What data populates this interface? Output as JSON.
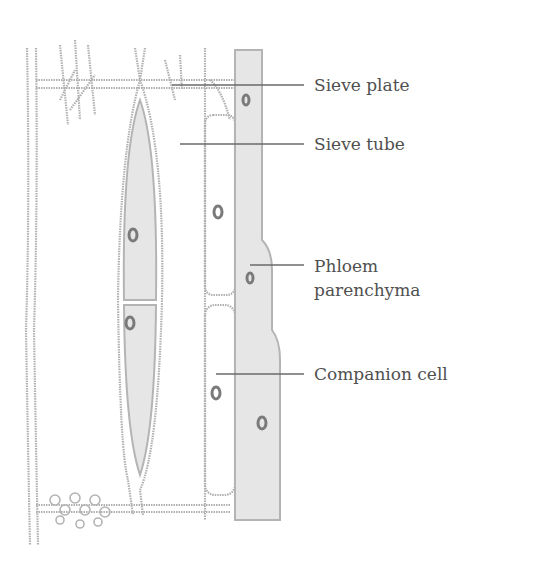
{
  "figure": {
    "labels": [
      {
        "id": "sieve-plate",
        "text": "Sieve plate",
        "x": 314,
        "y": 51
      },
      {
        "id": "sieve-tube",
        "text": "Sieve tube",
        "x": 314,
        "y": 106
      },
      {
        "id": "phloem-parenchyma-1",
        "text": "Phloem",
        "x": 314,
        "y": 263
      },
      {
        "id": "phloem-parenchyma-2",
        "text": "parenchyma",
        "x": 314,
        "y": 287
      },
      {
        "id": "companion-cell",
        "text": "Companion cell",
        "x": 314,
        "y": 370
      }
    ],
    "colors": {
      "outline": "#a8a8a8",
      "fill": "#e4e4e4",
      "leader": "#6a6a6a",
      "nucleus": "#8a8a8a",
      "text": "#505050"
    }
  }
}
